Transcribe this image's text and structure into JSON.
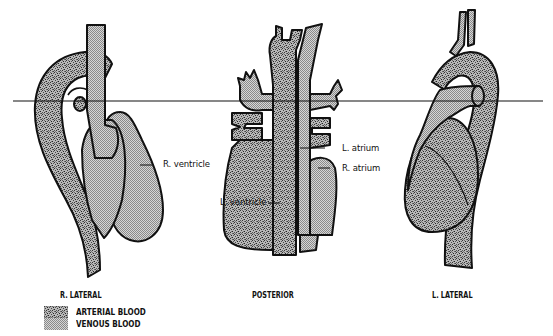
{
  "figure": {
    "views": [
      {
        "id": "r-lateral",
        "title": "R. LATERAL"
      },
      {
        "id": "posterior",
        "title": "POSTERIOR"
      },
      {
        "id": "l-lateral",
        "title": "L. LATERAL"
      }
    ],
    "annotations": [
      {
        "text": "R. ventricle",
        "view": "r-lateral"
      },
      {
        "text": "L. ventricle",
        "view": "posterior"
      },
      {
        "text": "L. atrium",
        "view": "posterior"
      },
      {
        "text": "R. atrium",
        "view": "posterior"
      }
    ],
    "legend": [
      {
        "label": "ARTERIAL BLOOD",
        "pattern": "stipple",
        "color": "#555555"
      },
      {
        "label": "VENOUS BLOOD",
        "pattern": "checker",
        "color": "#8a8a8a"
      }
    ],
    "reference_line": {
      "y": 101,
      "x1": 13,
      "x2": 543,
      "color": "#111111"
    }
  }
}
